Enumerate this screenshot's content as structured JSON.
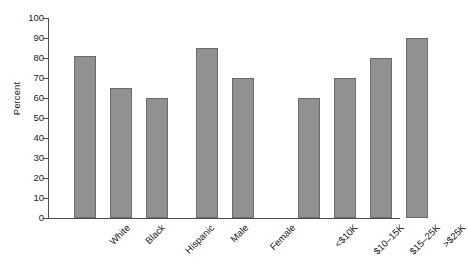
{
  "chart_data": {
    "type": "bar",
    "title": "",
    "subtitle": "",
    "xlabel": "",
    "ylabel": "Percent",
    "ylim": [
      0,
      100
    ],
    "yticks": [
      0,
      10,
      20,
      30,
      40,
      50,
      60,
      70,
      80,
      90,
      100
    ],
    "grid": false,
    "legend": false,
    "legend_position": "none",
    "bar_color": "#919191",
    "bar_edge_color": "#6b6b6b",
    "axis_color": "#4d4d4d",
    "background_color": "#ffffff",
    "categories": [
      "White",
      "Black",
      "Hispanic",
      "Male",
      "Female",
      "<$10K",
      "$10–15K",
      "$15–25K",
      ">$25K"
    ],
    "values": [
      81,
      65,
      60,
      85,
      70,
      60,
      70,
      80,
      90
    ],
    "groups": [
      {
        "name": "Race/Ethnicity",
        "categories": [
          "White",
          "Black",
          "Hispanic"
        ],
        "values": [
          81,
          65,
          60
        ]
      },
      {
        "name": "Sex",
        "categories": [
          "Male",
          "Female"
        ],
        "values": [
          85,
          70
        ]
      },
      {
        "name": "Income",
        "categories": [
          "<$10K",
          "$10–15K",
          "$15–25K",
          ">$25K"
        ],
        "values": [
          60,
          70,
          80,
          90
        ]
      }
    ]
  }
}
